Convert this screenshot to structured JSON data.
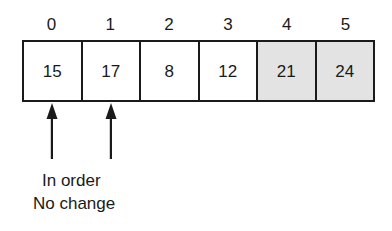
{
  "diagram": {
    "type": "array-sorting-step",
    "colors": {
      "ink": "#1a1a1a",
      "cell_background": "#ffffff",
      "shaded_cell_background": "#e3e3e3"
    },
    "array": {
      "indices": [
        "0",
        "1",
        "2",
        "3",
        "4",
        "5"
      ],
      "cells": [
        {
          "index": "0",
          "value": "15",
          "shaded": false
        },
        {
          "index": "1",
          "value": "17",
          "shaded": false
        },
        {
          "index": "2",
          "value": "8",
          "shaded": false
        },
        {
          "index": "3",
          "value": "12",
          "shaded": false
        },
        {
          "index": "4",
          "value": "21",
          "shaded": true
        },
        {
          "index": "5",
          "value": "24",
          "shaded": true
        }
      ]
    },
    "pointers": [
      {
        "name": "pointer-index-0",
        "target_index": "0"
      },
      {
        "name": "pointer-index-1",
        "target_index": "1"
      }
    ],
    "caption": {
      "line1": "In order",
      "line2": "No change"
    }
  }
}
